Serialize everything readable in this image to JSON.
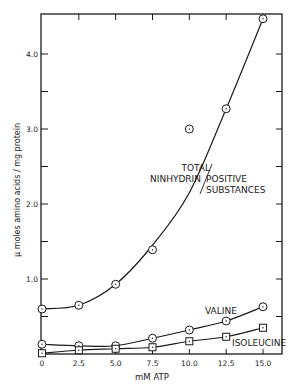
{
  "chart_data": {
    "type": "line",
    "title": "",
    "xlabel": "mM ATP",
    "ylabel": "μ moles amino acids / mg protein",
    "xlim": [
      0,
      15.0
    ],
    "ylim": [
      0,
      4.45
    ],
    "x_ticks": [
      "0",
      "2.5",
      "5.0",
      "7.5",
      "10.0",
      "12.5",
      "15.0"
    ],
    "y_ticks": [
      "1.0",
      "2.0",
      "3.0",
      "4.0"
    ],
    "grid": false,
    "legend_position": "inline labels",
    "x": [
      0,
      2.5,
      5.0,
      7.5,
      10.0,
      12.5,
      15.0
    ],
    "series": [
      {
        "name": "TOTAL NINHYDRIN POSITIVE SUBSTANCES",
        "marker": "circle-dot",
        "values": [
          0.6,
          0.65,
          0.93,
          1.39,
          3.0,
          3.27,
          4.47
        ]
      },
      {
        "name": "VALINE",
        "marker": "circle-dot",
        "values": [
          0.13,
          0.11,
          0.11,
          0.21,
          0.32,
          0.44,
          0.63
        ]
      },
      {
        "name": "ISOLEUCINE",
        "marker": "square-dot",
        "values": [
          0.01,
          0.05,
          0.07,
          0.09,
          0.17,
          0.23,
          0.35
        ]
      }
    ],
    "annotations": [
      "TOTAL",
      "NINHYDRIN",
      "POSITIVE",
      "SUBSTANCES",
      "VALINE",
      "ISOLEUCINE"
    ]
  },
  "labels": {
    "total_line1": "TOTAL",
    "total_line2a": "NINHYDRIN",
    "total_line2b": "POSITIVE",
    "total_line3": "SUBSTANCES",
    "valine": "VALINE",
    "isoleucine": "ISOLEUCINE",
    "xlabel": "mM ATP",
    "ylabel": "μ moles amino acids / mg protein"
  }
}
